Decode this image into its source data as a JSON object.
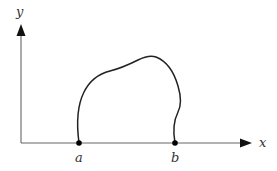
{
  "diagram": {
    "type": "curve-between-points",
    "axes": {
      "x_label": "x",
      "y_label": "y",
      "color": "#555555"
    },
    "points": [
      {
        "id": "a",
        "label": "a"
      },
      {
        "id": "b",
        "label": "b"
      }
    ],
    "curve": {
      "description": "closed-top curve rising from point a, peaking, and returning down to point b",
      "color": "#222222"
    }
  }
}
